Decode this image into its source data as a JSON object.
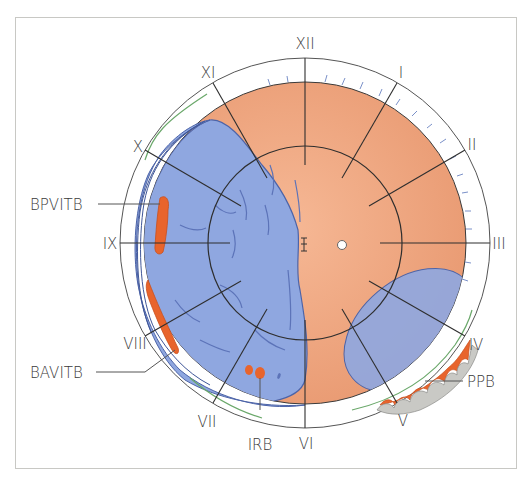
{
  "diagram": {
    "type": "fundus-chart",
    "clock_hours": [
      "XII",
      "I",
      "II",
      "III",
      "IV",
      "V",
      "VI",
      "VII",
      "VIII",
      "IX",
      "X",
      "XI"
    ],
    "annotations": [
      {
        "id": "bpvitb",
        "label": "BPVITB"
      },
      {
        "id": "bavitb",
        "label": "BAVITB"
      },
      {
        "id": "irb",
        "label": "IRB"
      },
      {
        "id": "ppb",
        "label": "PPB"
      }
    ],
    "colors": {
      "retina": "#f2a881",
      "detachment": "#8fa7e0",
      "break": "#e8642c",
      "lines": "#3a3a3a",
      "ora_marker": "#6aa86a",
      "frame": "#c8c8c4"
    }
  }
}
